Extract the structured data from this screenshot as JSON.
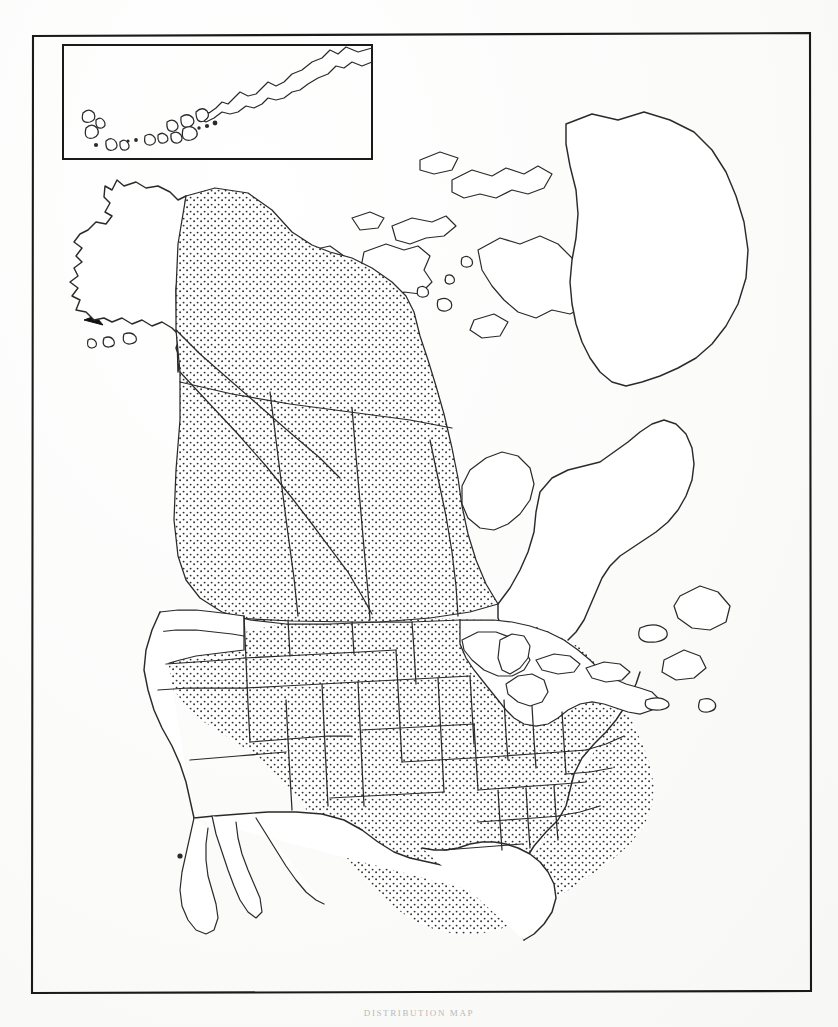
{
  "document": {
    "type": "distribution-map",
    "region": "North America",
    "caption": "DISTRIBUTION MAP",
    "background_color": "#fdfdfc",
    "ink_color": "#2a2a2a"
  },
  "frame": {
    "outer_border_label": "map-border",
    "x": 32,
    "y": 34,
    "width": 778,
    "height": 959
  },
  "inset": {
    "name": "Aleutian Islands inset",
    "label": "",
    "x": 62,
    "y": 44,
    "width": 310,
    "height": 116,
    "contents": "Aleutian Island chain and Alaska Peninsula, unshaded"
  },
  "pointer": {
    "name": "inset-locator-arrow",
    "style": "dashed line with solid arrowhead",
    "from": [
      205,
      283
    ],
    "to": [
      88,
      318
    ],
    "meaning": "links Aleutian inset to its geographic position"
  },
  "legend": {
    "shaded_pattern": "stipple-dots",
    "shaded_meaning": "range / occurrence",
    "unshaded_meaning": "absent"
  },
  "regions_shaded": [
    "Yukon",
    "Northwest Territories (mainland)",
    "British Columbia",
    "Alberta",
    "Saskatchewan",
    "Manitoba",
    "California",
    "Nevada",
    "Idaho",
    "Montana",
    "Wyoming",
    "Utah",
    "Arizona",
    "Colorado",
    "New Mexico",
    "North Dakota",
    "South Dakota",
    "Nebraska",
    "Kansas",
    "Oklahoma",
    "Texas",
    "Minnesota",
    "Iowa",
    "Missouri",
    "Arkansas",
    "Louisiana",
    "Wisconsin",
    "Illinois",
    "Indiana",
    "Ohio",
    "Kentucky",
    "Tennessee",
    "Mississippi",
    "Alabama",
    "Georgia",
    "Florida",
    "South Carolina",
    "North Carolina",
    "West Virginia"
  ],
  "regions_unshaded": [
    "Alaska",
    "Aleutian Islands",
    "Washington",
    "Oregon",
    "Arctic Archipelago",
    "Ontario",
    "Quebec",
    "Labrador",
    "Newfoundland",
    "Nova Scotia",
    "New Brunswick",
    "Greenland",
    "Michigan",
    "New York",
    "Pennsylvania",
    "Virginia",
    "Maryland",
    "New England",
    "Mexico",
    "Baja California"
  ],
  "colors": {
    "ink": "#2a2a2a",
    "frame": "#1a1a1a",
    "paper": "#fdfdfc",
    "stipple": "#333333"
  }
}
